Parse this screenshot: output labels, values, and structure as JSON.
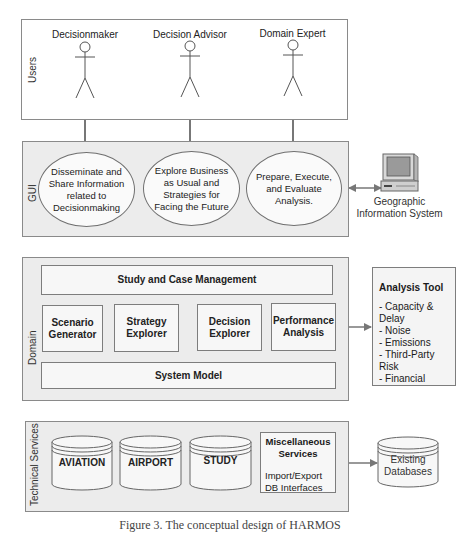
{
  "layers": {
    "users": {
      "label": "Users"
    },
    "gui": {
      "label": "GUI"
    },
    "domain": {
      "label": "Domain"
    },
    "technical": {
      "label": "Technical Services"
    }
  },
  "actors": [
    {
      "label": "Decisionmaker"
    },
    {
      "label": "Decision Advisor"
    },
    {
      "label": "Domain Expert"
    }
  ],
  "gui_functions": [
    {
      "label": "Disseminate and Share Information related to Decisionmaking"
    },
    {
      "label": "Explore Business as Usual and Strategies for Facing the Future"
    },
    {
      "label": "Prepare, Execute, and Evaluate Analysis."
    }
  ],
  "gis": {
    "label_line1": "Geographic",
    "label_line2": "Information System",
    "icon": "computer-icon"
  },
  "domain": {
    "top": "Study and Case Management",
    "modules": [
      {
        "label": "Scenario Generator"
      },
      {
        "label": "Strategy Explorer"
      },
      {
        "label": "Decision Explorer"
      },
      {
        "label": "Performance Analysis"
      }
    ],
    "bottom": "System Model"
  },
  "analysis_tool": {
    "title": "Analysis Tool",
    "items": [
      "- Capacity & Delay",
      "- Noise",
      "- Emissions",
      "- Third-Party Risk",
      "- Financial"
    ]
  },
  "technical": {
    "databases": [
      {
        "label": "AVIATION"
      },
      {
        "label": "AIRPORT"
      },
      {
        "label": "STUDY"
      }
    ],
    "misc": {
      "title": "Miscellaneous Services",
      "line1": "Import/Export",
      "line2": "DB Interfaces"
    }
  },
  "existing_db": {
    "line1": "Existing",
    "line2": "Databases"
  },
  "caption": "Figure 3. The conceptual design of HARMOS",
  "colors": {
    "layer_fill": "#ececec",
    "border": "#8a8a8a",
    "arrow": "#777777"
  }
}
